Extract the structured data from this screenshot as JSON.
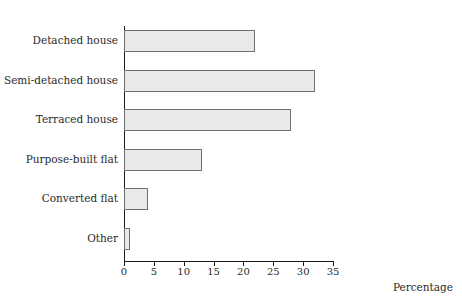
{
  "chart_data": {
    "type": "bar",
    "orientation": "horizontal",
    "title": "",
    "title_note": "title row is cropped off the top edge of the screenshot and is not legible",
    "categories": [
      "Detached house",
      "Semi-detached house",
      "Terraced house",
      "Purpose-built flat",
      "Converted flat",
      "Other"
    ],
    "values": [
      22,
      32,
      28,
      13,
      4,
      1
    ],
    "xlabel": "Percentage",
    "ylabel": "",
    "xlim": [
      0,
      35
    ],
    "xticks": [
      0,
      5,
      10,
      15,
      20,
      25,
      30,
      35
    ],
    "xtick_labels": [
      "0",
      "5",
      "10",
      "15",
      "20",
      "25",
      "30",
      "35"
    ],
    "grid": false,
    "legend": null,
    "bar_fill_color": "#e9e9e9",
    "bar_border_color": "#707070",
    "axis_color": "#1a1a1a",
    "text_color": "#2a2a2a"
  }
}
